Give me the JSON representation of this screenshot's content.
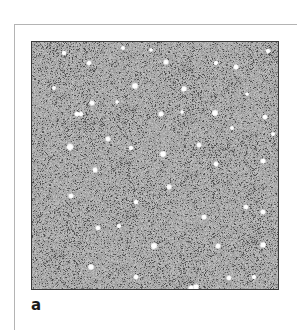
{
  "figure": {
    "panel_label": "a",
    "image": {
      "description": "grayscale speckle-noise micrograph with scattered bright white spots",
      "background_gray": "#a9a9a9",
      "speckle_dark": "#4a4a4a",
      "spot_color": "#ffffff",
      "border_color": "#3a3a3a",
      "spots": [
        [
          32,
          11,
          1.6
        ],
        [
          57,
          21,
          1.8
        ],
        [
          91,
          6,
          1.2
        ],
        [
          134,
          20,
          2.0
        ],
        [
          103,
          44,
          2.6
        ],
        [
          152,
          47,
          2.2
        ],
        [
          184,
          21,
          1.4
        ],
        [
          204,
          25,
          2.0
        ],
        [
          236,
          9,
          1.8
        ],
        [
          22,
          46,
          1.2
        ],
        [
          60,
          61,
          2.0
        ],
        [
          45,
          72,
          1.8
        ],
        [
          49,
          72,
          1.8
        ],
        [
          129,
          72,
          2.0
        ],
        [
          183,
          71,
          2.6
        ],
        [
          233,
          75,
          1.8
        ],
        [
          76,
          97,
          2.0
        ],
        [
          38,
          105,
          3.0
        ],
        [
          99,
          106,
          1.6
        ],
        [
          167,
          103,
          1.8
        ],
        [
          131,
          112,
          2.6
        ],
        [
          63,
          128,
          2.0
        ],
        [
          184,
          122,
          1.8
        ],
        [
          231,
          119,
          2.0
        ],
        [
          137,
          145,
          2.0
        ],
        [
          39,
          154,
          2.0
        ],
        [
          104,
          160,
          1.8
        ],
        [
          214,
          165,
          1.8
        ],
        [
          231,
          170,
          2.0
        ],
        [
          172,
          175,
          2.0
        ],
        [
          66,
          186,
          1.8
        ],
        [
          87,
          184,
          1.4
        ],
        [
          122,
          204,
          2.8
        ],
        [
          186,
          204,
          2.0
        ],
        [
          231,
          203,
          2.4
        ],
        [
          59,
          225,
          2.4
        ],
        [
          104,
          235,
          1.8
        ],
        [
          197,
          236,
          1.8
        ],
        [
          222,
          235,
          1.4
        ],
        [
          164,
          245,
          2.4
        ],
        [
          159,
          246,
          2.0
        ],
        [
          200,
          86,
          1.2
        ],
        [
          150,
          70,
          1.0
        ],
        [
          85,
          60,
          1.0
        ],
        [
          241,
          92,
          1.2
        ],
        [
          119,
          8,
          1.0
        ],
        [
          215,
          52,
          1.0
        ]
      ]
    }
  }
}
